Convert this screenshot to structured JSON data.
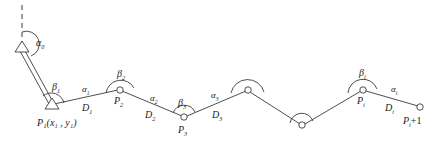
{
  "figure": {
    "type": "survey-traverse-diagram",
    "background": "#ffffff",
    "stroke_color": "#3a3a3a",
    "text_color": "#1c1c1c"
  },
  "labels": {
    "alpha0": {
      "base": "α",
      "sub": "0"
    },
    "beta1": {
      "base": "β",
      "sub": "1"
    },
    "beta2": {
      "base": "β",
      "sub": "2"
    },
    "beta3": {
      "base": "β",
      "sub": "3"
    },
    "betai": {
      "base": "β",
      "sub": "i"
    },
    "alpha1": {
      "base": "α",
      "sub": "1"
    },
    "alpha2": {
      "base": "α",
      "sub": "2"
    },
    "alpha3": {
      "base": "α",
      "sub": "3"
    },
    "alphai": {
      "base": "α",
      "sub": "i"
    },
    "D1": {
      "base": "D",
      "sub": "1"
    },
    "D2": {
      "base": "D",
      "sub": "2"
    },
    "D3": {
      "base": "D",
      "sub": "3"
    },
    "Di": {
      "base": "D",
      "sub": "i"
    },
    "P1": {
      "base": "P",
      "sub": "1",
      "coords": "(x₁ , y₁)"
    },
    "P1_full": "P₁(x₁ , y₁)",
    "P2": {
      "base": "P",
      "sub": "2"
    },
    "P3": {
      "base": "P",
      "sub": "3"
    },
    "Pi": {
      "base": "P",
      "sub": "i"
    },
    "Pi_plus_1": {
      "base": "P",
      "sub": "i",
      "suffix": "+1"
    }
  },
  "nodes": [
    {
      "name": "station-A",
      "shape": "triangle",
      "x": 22,
      "y": 47,
      "label": null
    },
    {
      "name": "station-P1",
      "shape": "triangle",
      "x": 52,
      "y": 105,
      "label": "P1"
    },
    {
      "name": "station-P2",
      "shape": "circle",
      "x": 120,
      "y": 90,
      "label": "P2"
    },
    {
      "name": "station-P3",
      "shape": "circle",
      "x": 184,
      "y": 117,
      "label": "P3"
    },
    {
      "name": "station-unlabeled-1",
      "shape": "circle",
      "x": 248,
      "y": 90,
      "label": null
    },
    {
      "name": "station-unlabeled-2",
      "shape": "circle",
      "x": 302,
      "y": 125,
      "label": null
    },
    {
      "name": "station-Pi",
      "shape": "circle",
      "x": 363,
      "y": 90,
      "label": "Pi"
    },
    {
      "name": "station-Pi-plus-1",
      "shape": "circle",
      "x": 420,
      "y": 107,
      "label": "Pi_plus_1"
    }
  ],
  "reference_line": {
    "name": "north-reference",
    "style": "dashed",
    "from": {
      "x": 22,
      "y": 6
    },
    "to": {
      "x": 22,
      "y": 44
    }
  },
  "baseline": {
    "name": "connecting-baseline",
    "style": "double-line",
    "from": {
      "x": 22,
      "y": 50
    },
    "to": {
      "x": 51,
      "y": 103
    }
  },
  "segments": [
    {
      "name": "segment-D1",
      "from": "station-P1",
      "to": "station-P2",
      "distance_label": "D1",
      "azimuth_label": "alpha1"
    },
    {
      "name": "segment-D2",
      "from": "station-P2",
      "to": "station-P3",
      "distance_label": "D2",
      "azimuth_label": "alpha2"
    },
    {
      "name": "segment-D3",
      "from": "station-P3",
      "to": "station-unlabeled-1",
      "distance_label": "D3",
      "azimuth_label": "alpha3"
    },
    {
      "name": "segment-unlabeled-1",
      "from": "station-unlabeled-1",
      "to": "station-unlabeled-2",
      "distance_label": null,
      "azimuth_label": null
    },
    {
      "name": "segment-unlabeled-2",
      "from": "station-unlabeled-2",
      "to": "station-Pi",
      "distance_label": null,
      "azimuth_label": null
    },
    {
      "name": "segment-Di",
      "from": "station-Pi",
      "to": "station-Pi-plus-1",
      "distance_label": "Di",
      "azimuth_label": "alphai"
    }
  ],
  "angle_arcs": [
    {
      "name": "arc-alpha0",
      "at": "station-A",
      "label": "alpha0"
    },
    {
      "name": "arc-beta1",
      "at": "station-P1",
      "label": "beta1"
    },
    {
      "name": "arc-beta2",
      "at": "station-P2",
      "label": "beta2"
    },
    {
      "name": "arc-beta3",
      "at": "station-P3",
      "label": "beta3"
    },
    {
      "name": "arc-unlabeled-1",
      "at": "station-unlabeled-1",
      "label": null
    },
    {
      "name": "arc-unlabeled-2",
      "at": "station-unlabeled-2",
      "label": null
    },
    {
      "name": "arc-betai",
      "at": "station-Pi",
      "label": "betai"
    }
  ]
}
